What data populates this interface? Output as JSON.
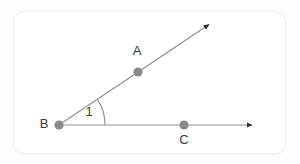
{
  "figure": {
    "type": "geometry-angle-diagram",
    "background_color": "#ffffff",
    "card_border_color": "#f0f0f0",
    "line_color": "#8f8f93",
    "point_color": "#8a8a8a",
    "label_color": "#3a3a3a",
    "vertex": {
      "name": "vertex-b",
      "label": "B",
      "x": 59,
      "y": 125,
      "label_x": 44,
      "label_y": 125
    },
    "points": [
      {
        "name": "point-a",
        "label": "A",
        "x": 138,
        "y": 72,
        "label_x": 137,
        "label_y": 52
      },
      {
        "name": "point-c",
        "label": "C",
        "x": 184,
        "y": 125,
        "label_x": 184,
        "label_y": 141
      }
    ],
    "rays": [
      {
        "name": "ray-ba",
        "from_label": "B",
        "through_label": "A",
        "x1": 59,
        "y1": 125,
        "x2": 212,
        "y2": 22,
        "arrow": "end"
      },
      {
        "name": "ray-bc",
        "from_label": "B",
        "through_label": "C",
        "x1": 59,
        "y1": 125,
        "x2": 256,
        "y2": 125,
        "arrow": "end"
      }
    ],
    "angle_arc": {
      "name": "angle-arc",
      "label": "1",
      "label_x": 89,
      "label_y": 113,
      "radius": 46,
      "vertex_x": 59,
      "vertex_y": 125,
      "start_x": 104,
      "start_y": 125,
      "end_x": 97,
      "end_y": 98,
      "sweep_description": "from horizontal ray up to slanted ray"
    }
  }
}
